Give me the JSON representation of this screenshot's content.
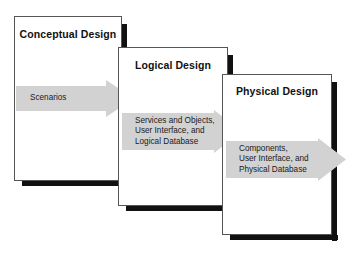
{
  "diagram": {
    "colors": {
      "box_fill": "#ffffff",
      "box_border": "#555555",
      "box_shadow": "#111111",
      "arrow_fill": "#d2d2d2",
      "text": "#111111",
      "background": "#ffffff"
    },
    "phases": [
      {
        "id": "conceptual",
        "title": "Conceptual Design",
        "arrow": {
          "id": "scenarios",
          "label": "Scenarios"
        }
      },
      {
        "id": "logical",
        "title": "Logical Design",
        "arrow": {
          "id": "logical-outputs",
          "label": "Services and Objects,\nUser Interface, and\nLogical Database"
        }
      },
      {
        "id": "physical",
        "title": "Physical Design",
        "arrow": {
          "id": "physical-outputs",
          "label": "Components,\nUser Interface, and\nPhysical Database"
        }
      }
    ]
  }
}
